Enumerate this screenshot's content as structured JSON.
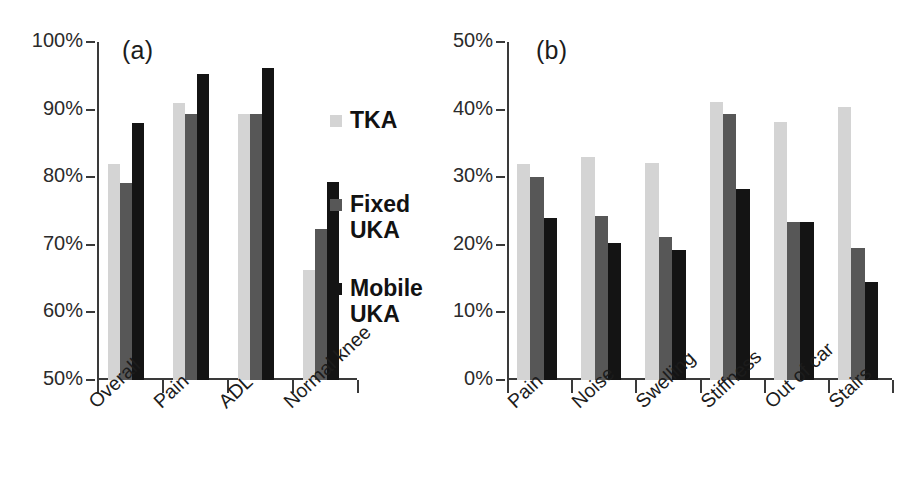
{
  "figure": {
    "background": "#ffffff",
    "series_colors": {
      "TKA": "#d4d4d4",
      "Fixed UKA": "#575757",
      "Mobile UKA": "#141414"
    }
  },
  "legend": {
    "position": "center-right-of-panel-a",
    "entries": [
      {
        "label": "TKA",
        "color": "#d4d4d4",
        "swatch": "legend-swatch-tka"
      },
      {
        "label": "Fixed\nUKA",
        "color": "#575757",
        "swatch": "legend-swatch-fixed-uka"
      },
      {
        "label": "Mobile\nUKA",
        "color": "#141414",
        "swatch": "legend-swatch-mobile-uka"
      }
    ]
  },
  "panel_a": {
    "label": "(a)",
    "yticks": [
      "100%",
      "90%",
      "80%",
      "70%",
      "60%",
      "50%"
    ]
  },
  "panel_b": {
    "label": "(b)",
    "yticks": [
      "50%",
      "40%",
      "30%",
      "20%",
      "10%",
      "0%"
    ]
  },
  "chart_data": [
    {
      "type": "bar",
      "title": "(a)",
      "xlabel": "",
      "ylabel": "",
      "ylim": [
        50,
        100
      ],
      "ytick_values": [
        50,
        60,
        70,
        80,
        90,
        100
      ],
      "ytick_labels": [
        "50%",
        "60%",
        "70%",
        "80%",
        "90%",
        "100%"
      ],
      "grid": false,
      "legend_position": "right",
      "categories": [
        "Overall",
        "Pain",
        "ADL",
        "Normal knee"
      ],
      "series": [
        {
          "name": "TKA",
          "color": "#d4d4d4",
          "values": [
            82.0,
            91.0,
            89.3,
            66.3
          ]
        },
        {
          "name": "Fixed UKA",
          "color": "#575757",
          "values": [
            79.2,
            89.3,
            89.3,
            72.3
          ]
        },
        {
          "name": "Mobile UKA",
          "color": "#141414",
          "values": [
            88.0,
            95.3,
            96.2,
            79.3
          ]
        }
      ]
    },
    {
      "type": "bar",
      "title": "(b)",
      "xlabel": "",
      "ylabel": "",
      "ylim": [
        0,
        50
      ],
      "ytick_values": [
        0,
        10,
        20,
        30,
        40,
        50
      ],
      "ytick_labels": [
        "0%",
        "10%",
        "20%",
        "30%",
        "40%",
        "50%"
      ],
      "grid": false,
      "legend_position": "none",
      "categories": [
        "Pain",
        "Noise",
        "Swelling",
        "Stiffness",
        "Out of car",
        "Stairs"
      ],
      "series": [
        {
          "name": "TKA",
          "color": "#d4d4d4",
          "values": [
            32.0,
            33.0,
            32.1,
            41.2,
            38.2,
            40.4
          ]
        },
        {
          "name": "Fixed UKA",
          "color": "#575757",
          "values": [
            30.1,
            24.2,
            21.2,
            39.4,
            23.4,
            19.5
          ]
        },
        {
          "name": "Mobile UKA",
          "color": "#141414",
          "values": [
            24.0,
            20.2,
            19.2,
            28.3,
            23.4,
            14.5
          ]
        }
      ]
    }
  ]
}
